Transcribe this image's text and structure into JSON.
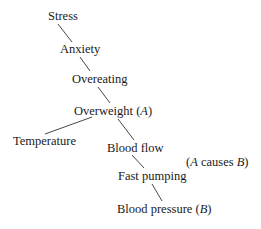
{
  "diagram": {
    "type": "causal-chain",
    "nodes": [
      {
        "id": "stress",
        "label": "Stress",
        "x": 48,
        "y": 9
      },
      {
        "id": "anxiety",
        "label": "Anxiety",
        "x": 60,
        "y": 42
      },
      {
        "id": "overeating",
        "label": "Overeating",
        "x": 72,
        "y": 72
      },
      {
        "id": "overweight",
        "label": "Overweight (",
        "var": "A",
        "suffix": ")",
        "x": 74,
        "y": 104
      },
      {
        "id": "temperature",
        "label": "Temperature",
        "x": 13,
        "y": 134
      },
      {
        "id": "bloodflow",
        "label": "Blood flow",
        "x": 107,
        "y": 141
      },
      {
        "id": "fastpumping",
        "label": "Fast pumping",
        "x": 118,
        "y": 169
      },
      {
        "id": "bloodpressure",
        "label": "Blood pressure (",
        "var": "B",
        "suffix": ")",
        "x": 117,
        "y": 202
      }
    ],
    "edges": [
      {
        "from": "stress",
        "to": "anxiety",
        "x1": 58,
        "y1": 24,
        "x2": 72,
        "y2": 42
      },
      {
        "from": "anxiety",
        "to": "overeating",
        "x1": 80,
        "y1": 57,
        "x2": 90,
        "y2": 71
      },
      {
        "from": "overeating",
        "to": "overweight",
        "x1": 98,
        "y1": 87,
        "x2": 110,
        "y2": 103
      },
      {
        "from": "overweight",
        "to": "temperature",
        "x1": 92,
        "y1": 117,
        "x2": 45,
        "y2": 134
      },
      {
        "from": "overweight",
        "to": "bloodflow",
        "x1": 118,
        "y1": 119,
        "x2": 134,
        "y2": 140
      },
      {
        "from": "bloodflow",
        "to": "fastpumping",
        "x1": 132,
        "y1": 155,
        "x2": 144,
        "y2": 168
      },
      {
        "from": "fastpumping",
        "to": "bloodpressure",
        "x1": 152,
        "y1": 184,
        "x2": 162,
        "y2": 201
      }
    ],
    "annotation": {
      "open": "(",
      "var_a": "A",
      "mid": " causes ",
      "var_b": "B",
      "close": ")",
      "x": 186,
      "y": 155
    }
  }
}
